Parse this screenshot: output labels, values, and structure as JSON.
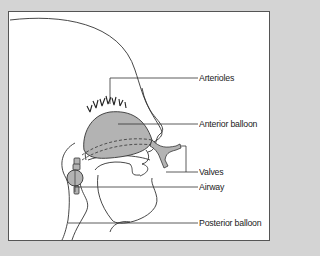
{
  "diagram": {
    "labels": [
      {
        "id": "arterioles",
        "text": "Arterioles"
      },
      {
        "id": "anterior_balloon",
        "text": "Anterior balloon"
      },
      {
        "id": "valves",
        "text": "Valves"
      },
      {
        "id": "airway",
        "text": "Airway"
      },
      {
        "id": "posterior_balloon",
        "text": "Posterior balloon"
      }
    ],
    "colors": {
      "background": "#d4d4d4",
      "panel": "#ffffff",
      "balloon_fill": "#b3b3b3",
      "line": "#333333"
    }
  }
}
